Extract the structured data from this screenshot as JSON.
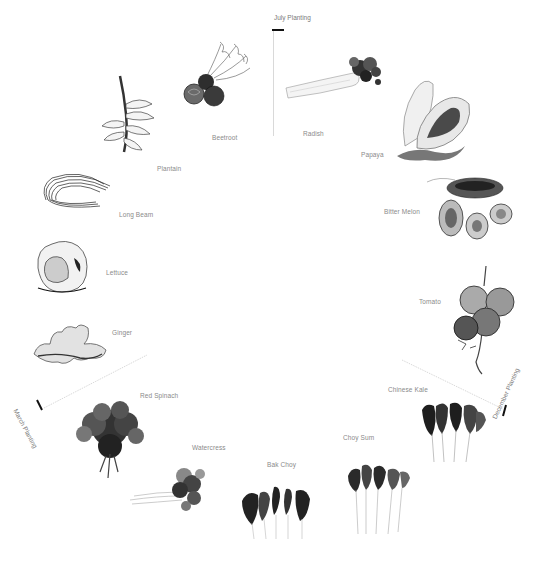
{
  "diagram": {
    "type": "planting-calendar-wheel",
    "seasons": [
      {
        "id": "july",
        "label": "July Planting"
      },
      {
        "id": "december",
        "label": "December Planting"
      },
      {
        "id": "march",
        "label": "March Planting"
      }
    ],
    "plants": [
      {
        "id": "beetroot",
        "label": "Beetroot",
        "icon": "beetroot-illustration"
      },
      {
        "id": "radish",
        "label": "Radish",
        "icon": "radish-illustration"
      },
      {
        "id": "papaya",
        "label": "Papaya",
        "icon": "papaya-illustration"
      },
      {
        "id": "bitter-melon",
        "label": "Bitter Melon",
        "icon": "bitter-melon-illustration"
      },
      {
        "id": "tomato",
        "label": "Tomato",
        "icon": "tomato-illustration"
      },
      {
        "id": "chinese-kale",
        "label": "Chinese Kale",
        "icon": "chinese-kale-illustration"
      },
      {
        "id": "choy-sum",
        "label": "Choy Sum",
        "icon": "choy-sum-illustration"
      },
      {
        "id": "bak-choy",
        "label": "Bak Choy",
        "icon": "bak-choy-illustration"
      },
      {
        "id": "watercress",
        "label": "Watercress",
        "icon": "watercress-illustration"
      },
      {
        "id": "red-spinach",
        "label": "Red Spinach",
        "icon": "red-spinach-illustration"
      },
      {
        "id": "ginger",
        "label": "Ginger",
        "icon": "ginger-illustration"
      },
      {
        "id": "lettuce",
        "label": "Lettuce",
        "icon": "lettuce-illustration"
      },
      {
        "id": "long-beam",
        "label": "Long Beam",
        "icon": "long-bean-illustration"
      },
      {
        "id": "plantain",
        "label": "Plantain",
        "icon": "plantain-illustration"
      }
    ],
    "colors": {
      "ink": "#1a1a1a",
      "label": "#8a8a8a",
      "divider": "#c8c8c8",
      "tick": "#111111"
    }
  }
}
